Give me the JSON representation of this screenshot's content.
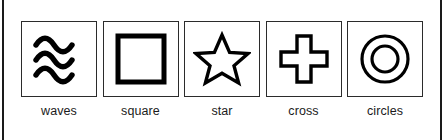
{
  "legend": {
    "border_color": "#1a1a1a",
    "swatch_border_color": "#2b2b2b",
    "glyph_color": "#000000",
    "background_color": "#ffffff",
    "items": [
      {
        "label": "waves",
        "icon": "waves-icon"
      },
      {
        "label": "square",
        "icon": "square-icon"
      },
      {
        "label": "star",
        "icon": "star-icon"
      },
      {
        "label": "cross",
        "icon": "cross-icon"
      },
      {
        "label": "circles",
        "icon": "circles-icon"
      }
    ]
  }
}
